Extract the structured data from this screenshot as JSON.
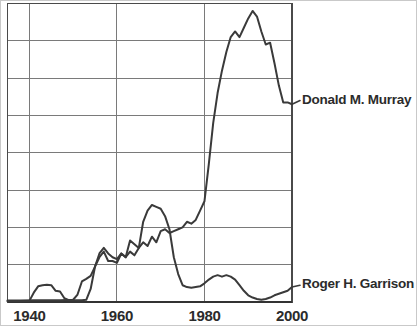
{
  "chart_data": {
    "type": "line",
    "title": "",
    "subtitle": "",
    "xlabel": "",
    "ylabel": "",
    "xlim": [
      1935,
      2000
    ],
    "ylim": [
      0,
      8
    ],
    "grid": true,
    "grid_x_values": [
      1940,
      1960,
      1980,
      2000
    ],
    "grid_y_count": 9,
    "legend_position": "right-inline",
    "xticks": [
      "1940",
      "1960",
      "1980",
      "2000"
    ],
    "xtick_values": [
      1940,
      1960,
      1980,
      2000
    ],
    "yticks": [],
    "series": [
      {
        "name": "Donald M. Murray",
        "color": "#3a3a3a",
        "label_x": 2001,
        "label_y": 5.4,
        "x": [
          1935,
          1938,
          1941,
          1944,
          1947,
          1950,
          1951,
          1952,
          1953,
          1954,
          1955,
          1956,
          1957,
          1958,
          1959,
          1960,
          1961,
          1962,
          1963,
          1964,
          1965,
          1966,
          1967,
          1968,
          1969,
          1970,
          1971,
          1972,
          1973,
          1974,
          1975,
          1976,
          1977,
          1978,
          1979,
          1980,
          1981,
          1982,
          1983,
          1984,
          1985,
          1986,
          1987,
          1988,
          1989,
          1990,
          1991,
          1992,
          1993,
          1994,
          1995,
          1996,
          1997,
          1998,
          1999,
          2000
        ],
        "y": [
          0.04,
          0.04,
          0.05,
          0.05,
          0.05,
          0.06,
          0.2,
          0.55,
          0.62,
          0.7,
          0.95,
          1.3,
          1.45,
          1.3,
          1.2,
          1.15,
          1.3,
          1.2,
          1.35,
          1.25,
          1.45,
          1.6,
          1.5,
          1.75,
          1.6,
          1.9,
          1.95,
          1.85,
          1.9,
          1.95,
          2.0,
          2.15,
          2.1,
          2.2,
          2.45,
          2.7,
          3.7,
          4.8,
          5.6,
          6.2,
          6.7,
          7.1,
          7.25,
          7.1,
          7.35,
          7.6,
          7.8,
          7.65,
          7.25,
          6.9,
          6.95,
          6.4,
          5.8,
          5.35,
          5.35,
          5.3
        ]
      },
      {
        "name": "Roger H. Garrison",
        "color": "#3a3a3a",
        "label_x": 2001,
        "label_y": 0.45,
        "x": [
          1935,
          1938,
          1940,
          1941,
          1942,
          1943,
          1944,
          1945,
          1946,
          1947,
          1948,
          1949,
          1950,
          1951,
          1952,
          1953,
          1954,
          1955,
          1956,
          1957,
          1958,
          1959,
          1960,
          1961,
          1962,
          1963,
          1964,
          1965,
          1966,
          1967,
          1968,
          1969,
          1970,
          1971,
          1972,
          1973,
          1974,
          1975,
          1976,
          1977,
          1978,
          1979,
          1980,
          1981,
          1982,
          1983,
          1984,
          1985,
          1986,
          1987,
          1988,
          1989,
          1990,
          1991,
          1992,
          1993,
          1994,
          1995,
          1996,
          1997,
          1998,
          1999,
          2000
        ],
        "y": [
          0.02,
          0.02,
          0.03,
          0.25,
          0.42,
          0.45,
          0.46,
          0.45,
          0.3,
          0.28,
          0.1,
          0.05,
          0.05,
          0.05,
          0.05,
          0.06,
          0.35,
          0.95,
          1.2,
          1.35,
          1.1,
          1.1,
          1.05,
          1.3,
          1.2,
          1.65,
          1.55,
          1.45,
          2.15,
          2.45,
          2.6,
          2.55,
          2.5,
          2.3,
          1.95,
          1.2,
          0.75,
          0.45,
          0.4,
          0.38,
          0.4,
          0.42,
          0.5,
          0.6,
          0.68,
          0.72,
          0.68,
          0.72,
          0.68,
          0.6,
          0.45,
          0.3,
          0.18,
          0.12,
          0.08,
          0.06,
          0.08,
          0.12,
          0.18,
          0.22,
          0.26,
          0.3,
          0.4
        ]
      }
    ]
  },
  "style": {
    "axis_color": "#4a4a4a",
    "grid_color": "#7a7a7a",
    "line_color": "#3a3a3a",
    "text_color": "#2b2b2b",
    "background": "#ffffff",
    "outer_border": "#c9c9c9"
  }
}
